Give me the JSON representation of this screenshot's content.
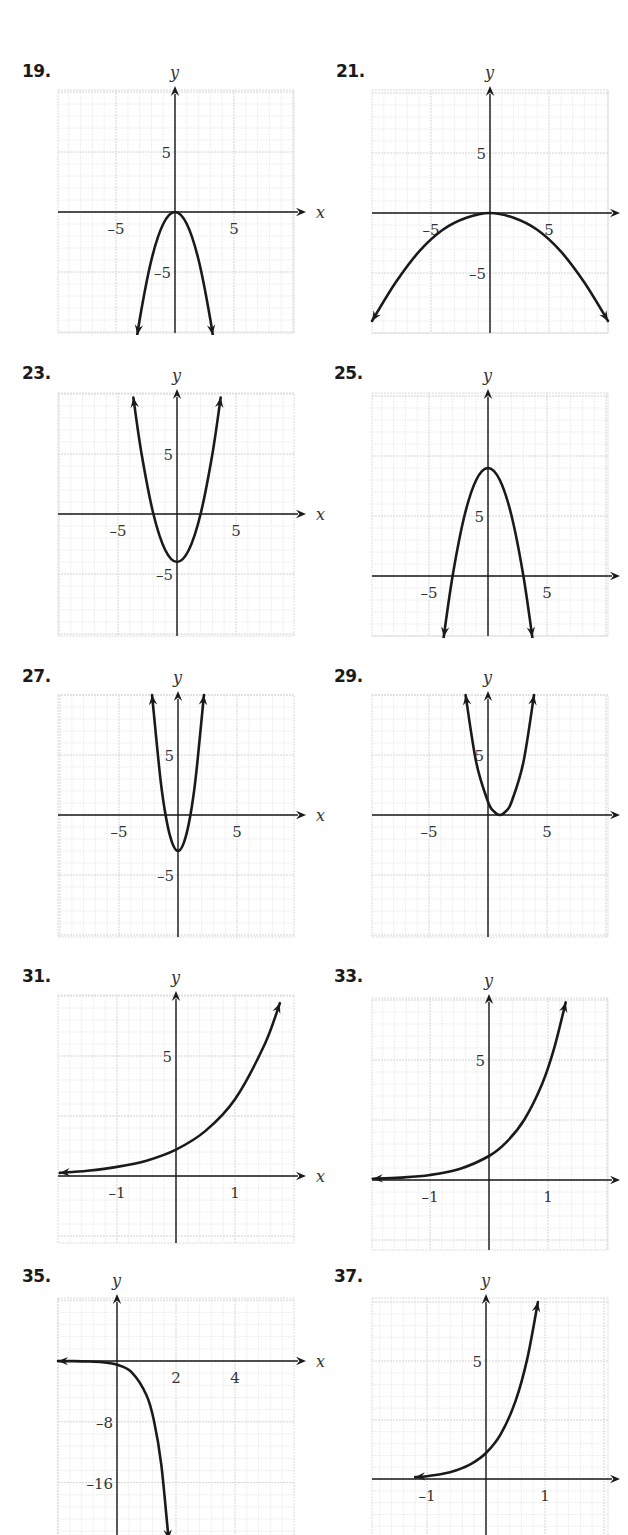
{
  "page": {
    "problems": [
      "19.",
      "21.",
      "23.",
      "25.",
      "27.",
      "29.",
      "31.",
      "33.",
      "35.",
      "37."
    ]
  },
  "chart_data": [
    {
      "id": "19",
      "label": "19.",
      "type": "line",
      "title": "",
      "xlabel": "x",
      "ylabel": "y",
      "xlim": [
        -10,
        10
      ],
      "ylim": [
        -10,
        10
      ],
      "grid": true,
      "xticks": [
        {
          "value": -5,
          "label": "–5"
        },
        {
          "value": 5,
          "label": "5"
        }
      ],
      "yticks": [
        {
          "value": 5,
          "label": "5"
        },
        {
          "value": -5,
          "label": "–5"
        }
      ],
      "series": [
        {
          "name": "curve",
          "description": "downward parabola, vertex (0,0)",
          "x": [
            -3.7,
            -3,
            -2,
            -1,
            0,
            1,
            2,
            3,
            3.7
          ],
          "y": [
            -13.7,
            -9,
            -4,
            -1,
            0,
            -1,
            -4,
            -9,
            -13.7
          ]
        }
      ],
      "arrows": {
        "start": true,
        "end": true
      }
    },
    {
      "id": "21",
      "label": "21.",
      "type": "line",
      "title": "",
      "xlabel": "x",
      "ylabel": "y",
      "xlim": [
        -10,
        10
      ],
      "ylim": [
        -10,
        10
      ],
      "grid": true,
      "xticks": [
        {
          "value": -5,
          "label": "–5"
        },
        {
          "value": 5,
          "label": "5"
        }
      ],
      "yticks": [
        {
          "value": 5,
          "label": "5"
        },
        {
          "value": -5,
          "label": "–5"
        }
      ],
      "series": [
        {
          "name": "curve",
          "description": "wide downward parabola, vertex (0,0)",
          "x": [
            -10,
            -8,
            -6,
            -4,
            -2,
            0,
            2,
            4,
            6,
            8,
            10
          ],
          "y": [
            -9,
            -5.8,
            -3.2,
            -1.4,
            -0.4,
            0,
            -0.4,
            -1.4,
            -3.2,
            -5.8,
            -9
          ]
        }
      ],
      "arrows": {
        "start": true,
        "end": true
      }
    },
    {
      "id": "23",
      "label": "23.",
      "type": "line",
      "title": "",
      "xlabel": "x",
      "ylabel": "y",
      "xlim": [
        -10,
        10
      ],
      "ylim": [
        -10,
        10
      ],
      "grid": true,
      "xticks": [
        {
          "value": -5,
          "label": "–5"
        },
        {
          "value": 5,
          "label": "5"
        }
      ],
      "yticks": [
        {
          "value": 5,
          "label": "5"
        },
        {
          "value": -5,
          "label": "–5"
        }
      ],
      "series": [
        {
          "name": "curve",
          "description": "upward parabola, vertex (0,-4), x-intercepts ±2",
          "x": [
            -3.7,
            -3,
            -2,
            -1,
            0,
            1,
            2,
            3,
            3.7
          ],
          "y": [
            9.7,
            5,
            0,
            -3,
            -4,
            -3,
            0,
            5,
            9.7
          ]
        }
      ],
      "arrows": {
        "start": true,
        "end": true
      }
    },
    {
      "id": "25",
      "label": "25.",
      "type": "line",
      "title": "",
      "xlabel": "x",
      "ylabel": "y",
      "xlim": [
        -10,
        10
      ],
      "ylim": [
        -5,
        15
      ],
      "grid": true,
      "xticks": [
        {
          "value": -5,
          "label": "–5"
        },
        {
          "value": 5,
          "label": "5"
        }
      ],
      "yticks": [
        {
          "value": 5,
          "label": "5"
        }
      ],
      "series": [
        {
          "name": "curve",
          "description": "downward parabola, vertex (0,9), x-intercepts ±3",
          "x": [
            -3.8,
            -3,
            -2,
            -1,
            0,
            1,
            2,
            3,
            3.8
          ],
          "y": [
            -5.4,
            0,
            5,
            8,
            9,
            8,
            5,
            0,
            -5.4
          ]
        }
      ],
      "arrows": {
        "start": true,
        "end": true
      }
    },
    {
      "id": "27",
      "label": "27.",
      "type": "line",
      "title": "",
      "xlabel": "x",
      "ylabel": "y",
      "xlim": [
        -10,
        10
      ],
      "ylim": [
        -10,
        10
      ],
      "grid": true,
      "xticks": [
        {
          "value": -5,
          "label": "–5"
        },
        {
          "value": 5,
          "label": "5"
        }
      ],
      "yticks": [
        {
          "value": 5,
          "label": "5"
        },
        {
          "value": -5,
          "label": "–5"
        }
      ],
      "series": [
        {
          "name": "curve",
          "description": "narrow upward parabola, vertex (0,-3)",
          "x": [
            -2.2,
            -1.5,
            -1,
            -0.5,
            0,
            0.5,
            1,
            1.5,
            2.2
          ],
          "y": [
            10,
            3.1,
            -0.3,
            -2.3,
            -3,
            -2.3,
            -0.3,
            3.1,
            10
          ]
        }
      ],
      "arrows": {
        "start": true,
        "end": true
      }
    },
    {
      "id": "29",
      "label": "29.",
      "type": "line",
      "title": "",
      "xlabel": "x",
      "ylabel": "y",
      "xlim": [
        -10,
        10
      ],
      "ylim": [
        -10,
        10
      ],
      "grid": true,
      "xticks": [
        {
          "value": -5,
          "label": "–5"
        },
        {
          "value": 5,
          "label": "5"
        }
      ],
      "yticks": [
        {
          "value": 5,
          "label": "5"
        }
      ],
      "series": [
        {
          "name": "curve",
          "description": "upward parabola, vertex (1,0)",
          "x": [
            -1.9,
            -1,
            0,
            0.5,
            1,
            1.5,
            2,
            3,
            3.9
          ],
          "y": [
            10,
            4.4,
            1.1,
            0.3,
            0,
            0.3,
            1.1,
            4.4,
            10
          ]
        }
      ],
      "arrows": {
        "start": true,
        "end": true
      }
    },
    {
      "id": "31",
      "label": "31.",
      "type": "line",
      "title": "",
      "xlabel": "x",
      "ylabel": "y",
      "xlim": [
        -2,
        2
      ],
      "ylim": [
        -3,
        7.5
      ],
      "grid": true,
      "xticks": [
        {
          "value": -1,
          "label": "–1"
        },
        {
          "value": 1,
          "label": "1"
        }
      ],
      "yticks": [
        {
          "value": 5,
          "label": "5"
        }
      ],
      "series": [
        {
          "name": "curve",
          "description": "increasing exponential, y-intercept ≈1.1",
          "x": [
            -1.97,
            -1.5,
            -1,
            -0.5,
            0,
            0.5,
            1,
            1.5,
            1.76
          ],
          "y": [
            0.13,
            0.22,
            0.38,
            0.64,
            1.1,
            1.88,
            3.2,
            5.47,
            7.2
          ]
        }
      ],
      "arrows": {
        "start": true,
        "end": true
      }
    },
    {
      "id": "33",
      "label": "33.",
      "type": "line",
      "title": "",
      "xlabel": "x",
      "ylabel": "y",
      "xlim": [
        -2,
        2
      ],
      "ylim": [
        -3,
        7.5
      ],
      "grid": true,
      "xticks": [
        {
          "value": -1,
          "label": "–1"
        },
        {
          "value": 1,
          "label": "1"
        }
      ],
      "yticks": [
        {
          "value": 5,
          "label": "5"
        }
      ],
      "series": [
        {
          "name": "curve",
          "description": "increasing exponential, y-intercept ≈1",
          "x": [
            -1.97,
            -1.5,
            -1,
            -0.5,
            0,
            0.3,
            0.6,
            0.9,
            1.1,
            1.3
          ],
          "y": [
            0.05,
            0.1,
            0.21,
            0.46,
            1.0,
            1.59,
            2.52,
            4.0,
            5.45,
            7.4
          ]
        }
      ],
      "arrows": {
        "start": true,
        "end": true
      }
    },
    {
      "id": "35",
      "label": "35.",
      "type": "line",
      "title": "",
      "xlabel": "x",
      "ylabel": "y",
      "xlim": [
        -2,
        6
      ],
      "ylim": [
        -24,
        8
      ],
      "grid": true,
      "xticks": [
        {
          "value": 2,
          "label": "2"
        },
        {
          "value": 4,
          "label": "4"
        }
      ],
      "yticks": [
        {
          "value": -8,
          "label": "–8"
        },
        {
          "value": -16,
          "label": "–16"
        }
      ],
      "series": [
        {
          "name": "curve",
          "description": "decreasing negative exponential, y-intercept ≈ -0.5",
          "x": [
            -2,
            -1.5,
            -1,
            -0.5,
            0,
            0.5,
            1,
            1.25,
            1.5,
            1.75
          ],
          "y": [
            -0.01,
            -0.02,
            -0.06,
            -0.17,
            -0.5,
            -1.5,
            -4.5,
            -7.8,
            -13.6,
            -23.5
          ]
        }
      ],
      "arrows": {
        "start": true,
        "end": true
      }
    },
    {
      "id": "37",
      "label": "37.",
      "type": "line",
      "title": "",
      "xlabel": "x",
      "ylabel": "y",
      "xlim": [
        -2,
        2
      ],
      "ylim": [
        -2.5,
        7.7
      ],
      "grid": true,
      "xticks": [
        {
          "value": -1,
          "label": "–1"
        },
        {
          "value": 1,
          "label": "1"
        }
      ],
      "yticks": [
        {
          "value": 5,
          "label": "5"
        }
      ],
      "series": [
        {
          "name": "curve",
          "description": "steep increasing exponential, y-intercept ≈1.1",
          "x": [
            -1.2,
            -1,
            -0.75,
            -0.5,
            -0.25,
            0,
            0.25,
            0.5,
            0.7,
            0.88
          ],
          "y": [
            0.08,
            0.12,
            0.21,
            0.37,
            0.64,
            1.1,
            1.9,
            3.3,
            5.1,
            7.5
          ]
        }
      ],
      "arrows": {
        "start": true,
        "end": true
      }
    }
  ]
}
